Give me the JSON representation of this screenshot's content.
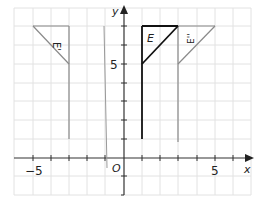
{
  "figure": {
    "title": "",
    "axes": {
      "x_label": "x",
      "y_label": "y",
      "origin_label": "O",
      "x_tick_labels": [
        {
          "value": -5,
          "text": "−5"
        },
        {
          "value": 5,
          "text": "5"
        }
      ],
      "y_tick_labels": [
        {
          "value": 5,
          "text": "5"
        }
      ],
      "x_range": [
        -6,
        7
      ],
      "y_range": [
        -2,
        8
      ]
    },
    "shapes": [
      {
        "name": "E",
        "label": "E",
        "style": "bold",
        "color": "#111111",
        "vertices": [
          [
            1,
            7
          ],
          [
            3,
            7
          ],
          [
            1,
            5
          ]
        ],
        "stem": [
          [
            1,
            7
          ],
          [
            1,
            1
          ]
        ],
        "stem2": [
          [
            3,
            7
          ],
          [
            3,
            1
          ]
        ]
      },
      {
        "name": "E-reflected-left",
        "label": "E'",
        "style": "light",
        "color": "#8a8a8a",
        "vertices": [
          [
            -5,
            7
          ],
          [
            -3,
            7
          ],
          [
            -3,
            5
          ]
        ],
        "stem": [
          [
            -3,
            7
          ],
          [
            -3,
            1
          ]
        ]
      },
      {
        "name": "E-translated-right",
        "label": "E''",
        "style": "light",
        "color": "#8a8a8a",
        "vertices": [
          [
            3,
            7
          ],
          [
            5,
            7
          ],
          [
            3,
            5
          ]
        ]
      }
    ],
    "colors": {
      "grid": "#e2e2e2",
      "axis": "#333333",
      "bold_shape": "#111111",
      "light_shape": "#8a8a8a"
    }
  }
}
